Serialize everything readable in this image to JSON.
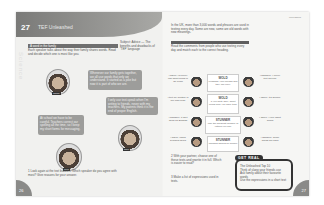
{
  "left_page": {
    "unit_number": "27",
    "unit_title": "TEF Unleashed",
    "section_heading": "A word in the family",
    "intro_text": "Each speaker talks about the way their family shares words. Read and decide which one is most like you.",
    "side_note": "Subject: Advice — The benefits and drawbacks of 'TEF' language",
    "vertical_watermark": "Science",
    "bubbles": [
      {
        "text": "Whenever our family gets together, we all use words that only we understand. It started as a joke but now it is part of who we are."
      },
      {
        "text": "I only use text-speak when I'm writing to friends, never with my teachers. My parents think it is the end of proper English."
      },
      {
        "text": "At school we have to be careful. Teachers correct our spelling all the time, so I keep my short forms for messaging."
      }
    ],
    "captions": [
      "Jamie",
      "Ravi",
      "Tom"
    ],
    "exercise_1": "1  Look again at the text bubbles. Which speaker do you agree with most? Give reasons for your answer.",
    "page_number": "26"
  },
  "right_page": {
    "running_head": "Unleashed",
    "intro_text": "In the UK, more than 3,000 words and phrases are used in texting every day. Some are new, some are old words with new meanings.",
    "section_heading": "The texting generation",
    "sub_text": "Read the comments from people who use texting every day and match each to the correct heading.",
    "left_chats": [
      "I agree: I'd never use short forms in an exam",
      "I text my brother in our own code",
      "I disagree, it isn't good for English",
      "I agree, using symbols helps"
    ],
    "cards": [
      {
        "heading": "WOLD",
        "body": "Message your friends and they will reply"
      },
      {
        "heading": "WOLD",
        "body": "If you write daily, short forms help you save time"
      },
      {
        "heading": "STUNNER",
        "body": "Use the smallest number of letters you can"
      },
      {
        "heading": "STUNNER",
        "body": "Phrases should be simple"
      }
    ],
    "right_chats": [
      "I disagree, I never text anyone",
      "I agree, it's quicker",
      "I agree, I love short forms",
      "I disagree, some words are hard"
    ],
    "exercise_2": "2  With your partner, choose one of these texts and rewrite it in full. Which is easier to read?",
    "exercise_3": "3  Make a list of expressions used in texts.",
    "get_real": {
      "tab": "GET REAL",
      "title": "The Unleashed Top 10",
      "items": [
        "Think of slang your friends use",
        "Ask family about their favourite words",
        "Use the expressions in a short text"
      ]
    },
    "page_number": "27"
  }
}
